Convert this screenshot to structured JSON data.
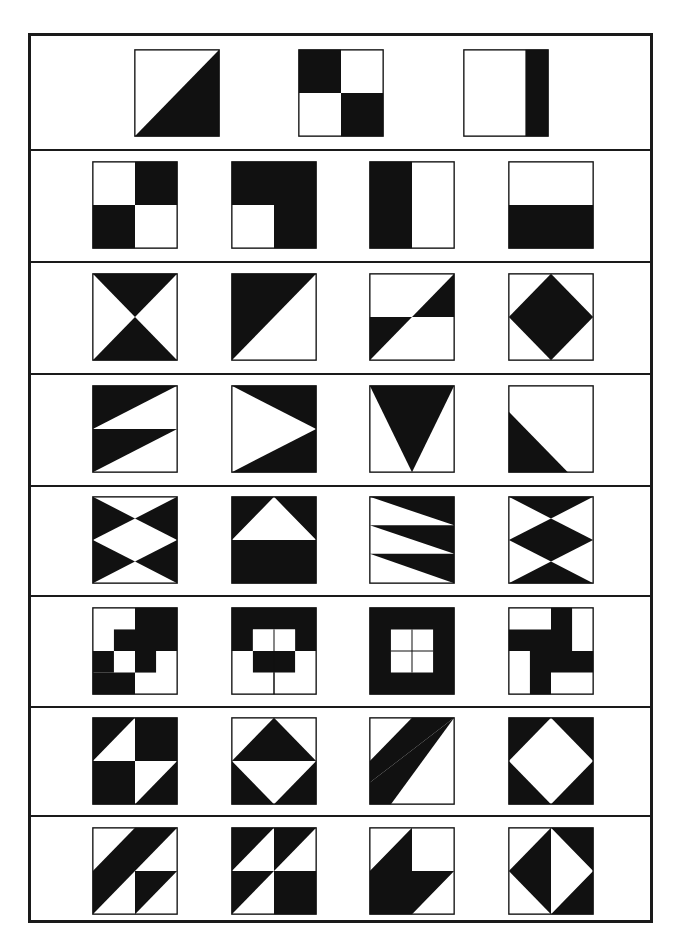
{
  "colors": {
    "ink": "#111111",
    "paper": "#ffffff"
  },
  "rows": [
    {
      "top": 0,
      "height": 113,
      "tiles": [
        {
          "x": 103,
          "shapes": [
            "100,0 100,100 0,100"
          ]
        },
        {
          "x": 267,
          "shapes": [
            "0,0 50,0 50,50 0,50",
            "50,50 100,50 100,100 50,100"
          ]
        },
        {
          "x": 432,
          "shapes": [
            "73,0 100,0 100,100 73,100"
          ]
        }
      ]
    },
    {
      "top": 113,
      "height": 112,
      "tiles": [
        {
          "x": 61,
          "shapes": [
            "50,0 100,0 100,50 50,50",
            "0,50 50,50 50,100 0,100"
          ]
        },
        {
          "x": 200,
          "shapes": [
            "0,0 100,0 100,100 50,100 50,50 0,50"
          ]
        },
        {
          "x": 338,
          "shapes": [
            "0,0 50,0 50,100 0,100"
          ]
        },
        {
          "x": 477,
          "shapes": [
            "0,50 100,50 100,100 0,100"
          ]
        }
      ]
    },
    {
      "top": 225,
      "height": 112,
      "tiles": [
        {
          "x": 61,
          "shapes": [
            "0,0 100,0 50,50",
            "50,50 100,100 0,100"
          ]
        },
        {
          "x": 200,
          "shapes": [
            "0,0 100,0 0,100"
          ]
        },
        {
          "x": 338,
          "shapes": [
            "50,50 100,0 100,50",
            "0,50 50,50 0,100"
          ]
        },
        {
          "x": 477,
          "shapes": [
            "50,0 100,50 50,100 0,50"
          ]
        }
      ]
    },
    {
      "top": 337,
      "height": 112,
      "tiles": [
        {
          "x": 61,
          "shapes": [
            "0,0 100,0 0,50",
            "0,50 100,50 0,100"
          ]
        },
        {
          "x": 200,
          "shapes": [
            "0,0 100,0 100,50",
            "100,50 100,100 0,100"
          ]
        },
        {
          "x": 338,
          "shapes": [
            "0,0 100,0 50,100"
          ]
        },
        {
          "x": 477,
          "shapes": [
            "0,30 70,100 0,100"
          ]
        }
      ]
    },
    {
      "top": 449,
      "height": 110,
      "tiles": [
        {
          "x": 61,
          "shapes": [
            "0,0 50,25 0,50",
            "100,0 50,25 100,50",
            "0,50 50,75 0,100",
            "100,50 50,75 100,100"
          ]
        },
        {
          "x": 200,
          "shapes": [
            "0,0 100,0 100,50 50,0 0,50",
            "0,50 100,50 100,100 0,100"
          ]
        },
        {
          "x": 338,
          "shapes": [
            "0,0 100,0 100,33",
            "0,33 100,33 100,66",
            "0,66 100,66 100,100"
          ]
        },
        {
          "x": 477,
          "shapes": [
            "0,0 100,0 50,25",
            "50,25 100,50 50,75 0,50",
            "50,75 100,100 0,100"
          ]
        }
      ]
    },
    {
      "top": 559,
      "height": 111,
      "tiles": [
        {
          "x": 61,
          "shapes": [
            "50,0 100,0 100,50 50,50",
            "25,25 50,25 50,50 25,50",
            "50,50 75,50 75,75 50,75",
            "0,50 25,50 25,75 0,75",
            "0,75 50,75 50,100 0,100"
          ]
        },
        {
          "x": 200,
          "shapes": [
            "0,0 100,0 100,50 75,50 75,25 25,25 25,50 0,50",
            "25,50 75,50 75,75 25,75"
          ],
          "lines": [
            "50,25 50,100",
            "25,37 75,37"
          ]
        },
        {
          "x": 338,
          "shapes": [
            "0,0 100,0 100,100 0,100"
          ],
          "white": [
            "25,25 75,25 75,75 25,75"
          ],
          "whiteLines": []
        },
        {
          "x": 477,
          "shapes": [
            "50,0 75,0 75,50 100,50 100,75 50,75 50,100 25,100 25,50 0,50 0,25 50,25"
          ]
        }
      ]
    },
    {
      "top": 670,
      "height": 109,
      "tiles": [
        {
          "x": 61,
          "shapes": [
            "0,0 50,0 0,50",
            "50,0 100,0 100,50 50,50",
            "0,50 50,50 50,100 0,100",
            "100,50 100,100 50,100"
          ]
        },
        {
          "x": 200,
          "shapes": [
            "50,0 100,50 0,50",
            "0,50 50,100 0,100",
            "100,50 100,100 50,100"
          ]
        },
        {
          "x": 338,
          "shapes": [
            "50,0 100,0 100,0 0,75 0,50 50,0",
            "100,0 100,0 25,100 0,100 0,75"
          ]
        },
        {
          "x": 477,
          "shapes": [
            "0,0 100,0 100,100 0,100"
          ],
          "white": [
            "50,0 100,50 50,100 0,50"
          ]
        }
      ]
    },
    {
      "top": 779,
      "height": 111,
      "tiles": [
        {
          "x": 61,
          "shapes": [
            "50,0 100,0 0,100 0,50",
            "50,50 100,50 50,100"
          ]
        },
        {
          "x": 200,
          "shapes": [
            "0,0 50,0 0,50",
            "50,0 100,0 50,50",
            "0,50 50,50 0,100",
            "50,50 100,50 100,100 50,100"
          ]
        },
        {
          "x": 338,
          "shapes": [
            "50,0 50,50 100,50 50,100 0,100 0,50"
          ]
        },
        {
          "x": 477,
          "shapes": [
            "50,0 0,50 50,100",
            "50,0 100,0 100,100 50,100 100,50"
          ]
        }
      ]
    }
  ]
}
